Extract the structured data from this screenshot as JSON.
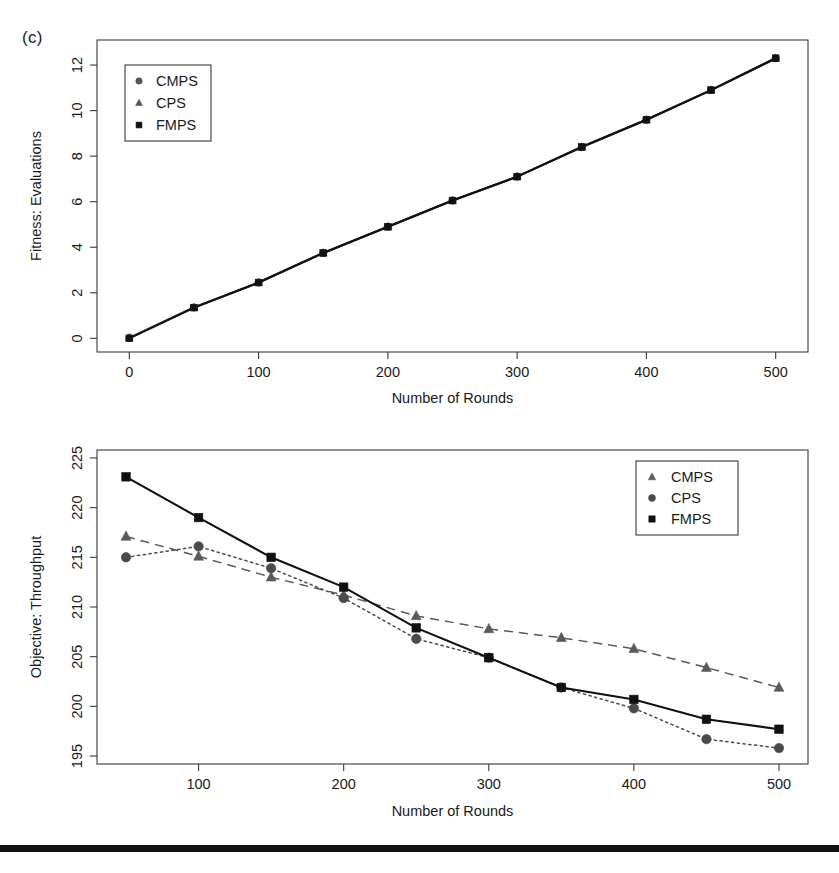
{
  "figure": {
    "panel_label": "(c)",
    "background": "#ffffff",
    "rule_color": "#111111"
  },
  "chart_data": [
    {
      "id": "top",
      "type": "line",
      "title": "",
      "xlabel": "Number of Rounds",
      "ylabel": "Fitness: Evaluations",
      "x": [
        0,
        50,
        100,
        150,
        200,
        250,
        300,
        350,
        400,
        450,
        500
      ],
      "xlim": [
        -25,
        525
      ],
      "ylim": [
        -0.6,
        13.1
      ],
      "xticks": [
        0,
        100,
        200,
        300,
        400,
        500
      ],
      "xtick_labels": [
        "0",
        "100",
        "200",
        "300",
        "400",
        "500"
      ],
      "yticks": [
        0,
        2,
        4,
        6,
        8,
        10,
        12
      ],
      "ytick_labels": [
        "0",
        "2",
        "4",
        "6",
        "8",
        "10",
        "12"
      ],
      "grid": false,
      "legend_position": "top-left",
      "series": [
        {
          "name": "CMPS",
          "marker": "circle",
          "line": "solid",
          "color": "#555555",
          "values": [
            0.02,
            1.35,
            2.45,
            3.75,
            4.9,
            6.05,
            7.1,
            8.4,
            9.6,
            10.9,
            12.3
          ]
        },
        {
          "name": "CPS",
          "marker": "triangle",
          "line": "solid",
          "color": "#555555",
          "values": [
            0.02,
            1.35,
            2.45,
            3.75,
            4.9,
            6.05,
            7.1,
            8.4,
            9.6,
            10.9,
            12.3
          ]
        },
        {
          "name": "FMPS",
          "marker": "square",
          "line": "solid",
          "color": "#111111",
          "values": [
            0.0,
            1.35,
            2.45,
            3.75,
            4.9,
            6.05,
            7.1,
            8.4,
            9.6,
            10.9,
            12.3
          ]
        }
      ],
      "legend": [
        "CMPS",
        "CPS",
        "FMPS"
      ]
    },
    {
      "id": "bottom",
      "type": "line",
      "title": "",
      "xlabel": "Number of Rounds",
      "ylabel": "Objective: Throughput",
      "x": [
        50,
        100,
        150,
        200,
        250,
        300,
        350,
        400,
        450,
        500
      ],
      "xlim": [
        30,
        520
      ],
      "ylim": [
        194.2,
        225.8
      ],
      "xticks": [
        100,
        200,
        300,
        400,
        500
      ],
      "xtick_labels": [
        "100",
        "200",
        "300",
        "400",
        "500"
      ],
      "yticks": [
        195,
        200,
        205,
        210,
        215,
        220,
        225
      ],
      "ytick_labels": [
        "195",
        "200",
        "205",
        "210",
        "215",
        "220",
        "225"
      ],
      "grid": false,
      "legend_position": "top-right",
      "series": [
        {
          "name": "CMPS",
          "marker": "triangle",
          "line": "dashed",
          "color": "#5a5a5a",
          "values": [
            217.1,
            215.1,
            213.0,
            211.2,
            209.1,
            207.8,
            206.9,
            205.8,
            203.9,
            201.9
          ]
        },
        {
          "name": "CPS",
          "marker": "circle",
          "line": "dotted",
          "color": "#4a4a4a",
          "values": [
            215.0,
            216.1,
            213.9,
            210.9,
            206.8,
            204.9,
            201.9,
            199.8,
            196.7,
            195.8
          ]
        },
        {
          "name": "FMPS",
          "marker": "square",
          "line": "solid",
          "color": "#111111",
          "values": [
            223.1,
            219.0,
            215.0,
            212.0,
            207.9,
            204.9,
            201.9,
            200.7,
            198.7,
            197.7
          ]
        }
      ],
      "legend": [
        "CMPS",
        "CPS",
        "FMPS"
      ]
    }
  ]
}
